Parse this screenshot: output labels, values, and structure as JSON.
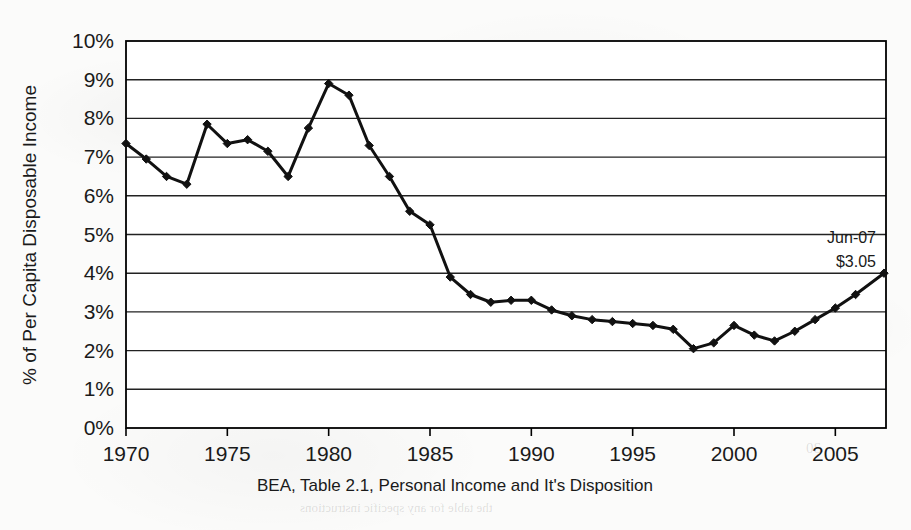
{
  "chart_data": {
    "type": "line",
    "title": "",
    "xlabel": "BEA, Table 2.1, Personal Income and It's Disposition",
    "ylabel": "% of Per Capita Disposable Income",
    "xlim": [
      1970,
      2007.5
    ],
    "ylim": [
      0,
      10
    ],
    "grid": true,
    "legend": false,
    "y_tick_labels": [
      "10%",
      "9%",
      "8%",
      "7%",
      "6%",
      "5%",
      "4%",
      "3%",
      "2%",
      "1%",
      "0%"
    ],
    "y_tick_values": [
      10,
      9,
      8,
      7,
      6,
      5,
      4,
      3,
      2,
      1,
      0
    ],
    "x_tick_labels": [
      "1970",
      "1975",
      "1980",
      "1985",
      "1990",
      "1995",
      "2000",
      "2005"
    ],
    "x_tick_values": [
      1970,
      1975,
      1980,
      1985,
      1990,
      1995,
      2000,
      2005
    ],
    "series": [
      {
        "name": "Share of per capita disposable income",
        "x": [
          1970,
          1971,
          1972,
          1973,
          1974,
          1975,
          1976,
          1977,
          1978,
          1979,
          1980,
          1981,
          1982,
          1983,
          1984,
          1985,
          1986,
          1987,
          1988,
          1989,
          1990,
          1991,
          1992,
          1993,
          1994,
          1995,
          1996,
          1997,
          1998,
          1999,
          2000,
          2001,
          2002,
          2003,
          2004,
          2005,
          2006,
          2007.4
        ],
        "values": [
          7.35,
          6.95,
          6.5,
          6.3,
          7.85,
          7.35,
          7.45,
          7.15,
          6.5,
          7.75,
          8.9,
          8.6,
          7.3,
          6.5,
          5.6,
          5.25,
          3.9,
          3.45,
          3.25,
          3.3,
          3.3,
          3.05,
          2.9,
          2.8,
          2.75,
          2.7,
          2.65,
          2.55,
          2.05,
          2.2,
          2.65,
          2.4,
          2.25,
          2.5,
          2.8,
          3.1,
          3.45,
          4.0
        ]
      }
    ],
    "annotations": [
      {
        "label_line1": "Jun-07",
        "label_line2": "$3.05",
        "x": 2007.4,
        "y": 4.0
      }
    ],
    "line_color": "#111111",
    "marker": "diamond",
    "plot_bg": "#ffffff",
    "axis_color": "#000000"
  },
  "caption": {
    "source_note": "BEA, Table 2.1, Personal Income and It's Disposition"
  },
  "axes": {
    "y_axis_title": "% of Per Capita Disposable Income"
  },
  "ghost_text": {
    "g1": "Sample Line",
    "g2": "the table for any specific instructions",
    "g3": "10",
    "g4": "20",
    "g5": "30"
  }
}
